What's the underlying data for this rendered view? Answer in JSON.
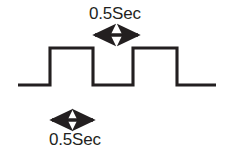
{
  "figure": {
    "background_color": "#ffffff",
    "stroke_color": "#231f20",
    "text_color": "#231f20",
    "width": 232,
    "height": 155
  },
  "annotations": {
    "top": {
      "label": "0.5Sec",
      "icon": "double-headed-arrow-horizontal",
      "measures": "high-pulse-width",
      "arrow_x_start": 93,
      "arrow_x_end": 140,
      "arrow_y": 35,
      "label_x": 89,
      "label_y": 4
    },
    "bottom": {
      "label": "0.5Sec",
      "icon": "double-headed-arrow-horizontal",
      "measures": "low-pulse-width",
      "arrow_x_start": 50,
      "arrow_x_end": 95,
      "arrow_y": 120,
      "label_x": 49,
      "label_y": 130
    }
  },
  "chart_data": {
    "type": "line",
    "title": "",
    "xlabel": "",
    "ylabel": "",
    "signal_name": "square-wave",
    "low_level_y": 85,
    "high_level_y": 48,
    "x_start": 18,
    "x_end": 216,
    "edges_x": [
      50,
      93,
      133,
      177
    ],
    "points": [
      [
        18,
        85
      ],
      [
        50,
        85
      ],
      [
        50,
        48
      ],
      [
        93,
        48
      ],
      [
        93,
        85
      ],
      [
        133,
        85
      ],
      [
        133,
        48
      ],
      [
        177,
        48
      ],
      [
        177,
        85
      ],
      [
        216,
        85
      ]
    ],
    "high_pulse_duration": "0.5Sec",
    "low_pulse_duration": "0.5Sec",
    "period": "1.0Sec",
    "duty_cycle_percent": 50,
    "grid": false,
    "legend": "none"
  }
}
